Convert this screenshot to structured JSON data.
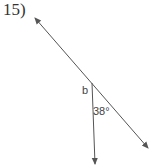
{
  "problem": {
    "number_label": "15)"
  },
  "diagram": {
    "line_color": "#555555",
    "text_color": "#444444",
    "labels": {
      "unknown_angle": "b",
      "given_angle": "38°"
    },
    "lines": [
      {
        "name": "transversal-line",
        "x1": 35,
        "y1": 18,
        "x2": 148,
        "y2": 148,
        "arrows": "both"
      },
      {
        "name": "ray-down",
        "x1": 92,
        "y1": 83,
        "x2": 95,
        "y2": 165,
        "arrows": "end"
      }
    ]
  }
}
